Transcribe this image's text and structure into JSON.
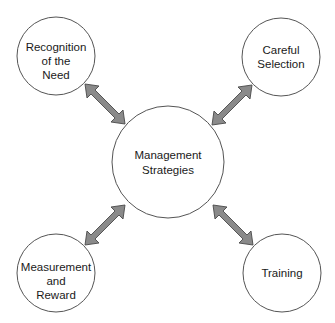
{
  "diagram": {
    "center": {
      "lines": [
        "Management",
        "Strategies"
      ]
    },
    "nodes": [
      {
        "id": "recognition",
        "lines": [
          "Recognition",
          "of the",
          "Need"
        ]
      },
      {
        "id": "selection",
        "lines": [
          "Careful",
          "Selection"
        ]
      },
      {
        "id": "measurement",
        "lines": [
          "Measurement",
          "and",
          "Reward"
        ]
      },
      {
        "id": "training",
        "lines": [
          "Training"
        ]
      }
    ],
    "colors": {
      "arrow_fill": "#8a8a8a",
      "arrow_stroke": "#4a4a4a",
      "circle_stroke": "#555555",
      "text": "#1a1a1a",
      "background": "#ffffff"
    }
  }
}
